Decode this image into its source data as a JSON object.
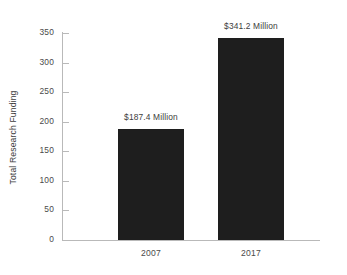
{
  "chart_data": {
    "type": "bar",
    "title": "",
    "subtitle": "",
    "xlabel": "",
    "ylabel": "Total Research Funding",
    "categories": [
      "2007",
      "2017"
    ],
    "values": [
      187.4,
      341.2
    ],
    "data_labels": [
      "$187.4 Million",
      "$341.2 Million"
    ],
    "ylim": [
      0,
      350
    ],
    "y_ticks": [
      0,
      50,
      100,
      150,
      200,
      250,
      300,
      350
    ],
    "y_tick_labels": [
      "0",
      "50",
      "100",
      "150",
      "200",
      "250",
      "300",
      "350"
    ],
    "grid": false,
    "legend": false,
    "legend_position": "none",
    "bar_color": "#1e1e1e",
    "background_color": "#ffffff",
    "axis_color": "#b9b9b9",
    "text_color": "#4a4a4a"
  }
}
